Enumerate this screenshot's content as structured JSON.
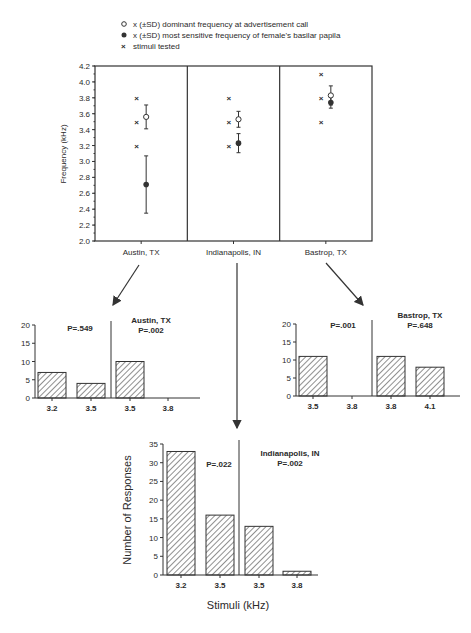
{
  "legend": {
    "items": [
      {
        "marker": "open-circle",
        "label": "x (±SD) dominant frequency at advertisement call"
      },
      {
        "marker": "filled-circle",
        "label": "x (±SD) most sensitive frequency of female's basilar papila"
      },
      {
        "marker": "x-cross",
        "label": "stimuli tested"
      }
    ]
  },
  "chart_data": [
    {
      "type": "scatter",
      "title": "",
      "xlabel": "",
      "ylabel": "Frequency (kHz)",
      "ylim": [
        2.0,
        4.2
      ],
      "yticks": [
        "2.0",
        "2.2",
        "2.4",
        "2.6",
        "2.8",
        "3.0",
        "3.2",
        "3.4",
        "3.6",
        "3.8",
        "4.0",
        "4.2"
      ],
      "categories": [
        "Austin, TX",
        "Indianapolis, IN",
        "Bastrop, TX"
      ],
      "series": [
        {
          "name": "dominant frequency at advertisement call",
          "marker": "open-circle",
          "values": [
            3.56,
            3.53,
            3.83
          ],
          "sd": [
            0.15,
            0.1,
            0.12
          ]
        },
        {
          "name": "most sensitive frequency of female's basilar papila",
          "marker": "filled-circle",
          "values": [
            2.71,
            3.23,
            3.74
          ],
          "sd": [
            0.36,
            0.12,
            0.07
          ]
        },
        {
          "name": "stimuli tested",
          "marker": "x-cross",
          "values": [
            [
              3.2,
              3.5,
              3.8
            ],
            [
              3.2,
              3.5,
              3.8
            ],
            [
              3.5,
              3.8,
              4.1
            ]
          ]
        }
      ]
    },
    {
      "type": "bar",
      "title": "Austin, TX",
      "ylim": [
        0,
        20
      ],
      "yticks": [
        "0",
        "5",
        "10",
        "15",
        "20"
      ],
      "categories": [
        "3.2",
        "3.5",
        "3.5",
        "3.8"
      ],
      "values": [
        7,
        4,
        10,
        0
      ],
      "groups": [
        {
          "p_label": "P=.549",
          "bars": [
            0,
            1
          ]
        },
        {
          "p_label": "P=.002",
          "bars": [
            2,
            3
          ]
        }
      ]
    },
    {
      "type": "bar",
      "title": "Bastrop, TX",
      "ylim": [
        0,
        20
      ],
      "yticks": [
        "0",
        "5",
        "10",
        "15",
        "20"
      ],
      "categories": [
        "3.5",
        "3.8",
        "3.8",
        "4.1"
      ],
      "values": [
        11,
        0,
        11,
        8
      ],
      "groups": [
        {
          "p_label": "P=.001",
          "bars": [
            0,
            1
          ]
        },
        {
          "p_label": "P=.648",
          "bars": [
            2,
            3
          ]
        }
      ]
    },
    {
      "type": "bar",
      "title": "Indianapolis, IN",
      "xlabel": "Stimuli (kHz)",
      "ylabel": "Number of Responses",
      "ylim": [
        0,
        35
      ],
      "yticks": [
        "0",
        "5",
        "10",
        "15",
        "20",
        "25",
        "30",
        "35"
      ],
      "categories": [
        "3.2",
        "3.5",
        "3.5",
        "3.8"
      ],
      "values": [
        33,
        16,
        13,
        1
      ],
      "groups": [
        {
          "p_label": "P=.022",
          "bars": [
            0,
            1
          ]
        },
        {
          "p_label": "P=.002",
          "bars": [
            2,
            3
          ]
        }
      ]
    }
  ]
}
